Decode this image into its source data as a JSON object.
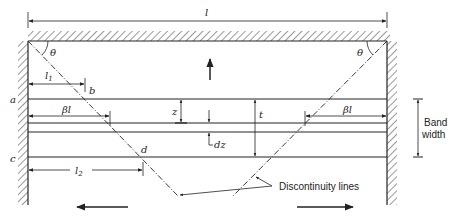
{
  "diagram": {
    "type": "tension-field beam diagram",
    "colors": {
      "ink": "#222222",
      "background": "#ffffff"
    },
    "labels": {
      "span": "l",
      "angle_left": "θ",
      "angle_right": "θ",
      "l1": "l",
      "l1_sub": "1",
      "l2": "l",
      "l2_sub": "2",
      "beta_l_left": "βl",
      "beta_l_right": "βl",
      "point_a": "a",
      "point_b": "b",
      "point_c": "c",
      "point_d": "d",
      "z": "z",
      "dz": "dz",
      "t": "t",
      "band_width_line1": "Band",
      "band_width_line2": "width",
      "discontinuity": "Discontinuity lines"
    },
    "arrows": {
      "up": "force-up",
      "left": "shear-left",
      "right": "shear-right"
    }
  }
}
